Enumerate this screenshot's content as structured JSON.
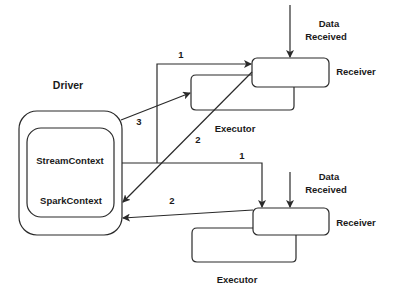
{
  "diagram": {
    "driver": {
      "title": "Driver",
      "stream_context": "StreamContext",
      "spark_context": "SparkContext"
    },
    "top_node": {
      "receiver": "Receiver",
      "executor": "Executor",
      "data_label_line1": "Data",
      "data_label_line2": "Received"
    },
    "bottom_node": {
      "receiver": "Receiver",
      "executor": "Executor",
      "data_label_line1": "Data",
      "data_label_line2": "Received"
    },
    "edges": {
      "top_1": "1",
      "top_2": "2",
      "top_3": "3",
      "bottom_1": "1",
      "bottom_2": "2"
    },
    "colors": {
      "stroke": "#2a2a2a",
      "text": "#1a1a1a",
      "background": "#ffffff"
    }
  }
}
